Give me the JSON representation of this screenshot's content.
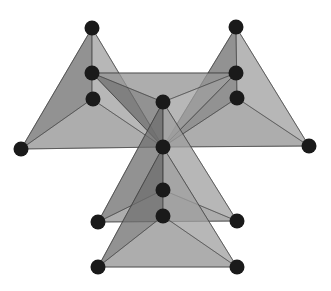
{
  "diagram": {
    "background": "#ffffff",
    "colors": {
      "face_light": "#a9a9a9",
      "face_mid": "#8a8a8a",
      "face_dark": "#5f5f5f",
      "edge": "#3a3a3a",
      "atom": "#1a1a1a"
    },
    "atoms": [
      {
        "id": "a1",
        "x": 92,
        "y": 28
      },
      {
        "id": "a2",
        "x": 236,
        "y": 27
      },
      {
        "id": "a3",
        "x": 92,
        "y": 73
      },
      {
        "id": "a4",
        "x": 93,
        "y": 99
      },
      {
        "id": "a5",
        "x": 236,
        "y": 73
      },
      {
        "id": "a6",
        "x": 237,
        "y": 98
      },
      {
        "id": "a7",
        "x": 163,
        "y": 102
      },
      {
        "id": "a8",
        "x": 163,
        "y": 147
      },
      {
        "id": "a9",
        "x": 21,
        "y": 149
      },
      {
        "id": "a10",
        "x": 309,
        "y": 146
      },
      {
        "id": "a11",
        "x": 163,
        "y": 190
      },
      {
        "id": "a12",
        "x": 163,
        "y": 216
      },
      {
        "id": "a13",
        "x": 98,
        "y": 222
      },
      {
        "id": "a14",
        "x": 98,
        "y": 267
      },
      {
        "id": "a15",
        "x": 237,
        "y": 221
      },
      {
        "id": "a16",
        "x": 237,
        "y": 267
      }
    ],
    "tetrahedra": [
      {
        "id": "t-left",
        "apex": [
          92,
          28
        ],
        "base": [
          [
            21,
            149
          ],
          [
            163,
            147
          ],
          [
            92,
            99
          ]
        ]
      },
      {
        "id": "t-right",
        "apex": [
          236,
          27
        ],
        "base": [
          [
            163,
            147
          ],
          [
            309,
            146
          ],
          [
            237,
            98
          ]
        ]
      },
      {
        "id": "t-center-up",
        "apex": [
          163,
          147
        ],
        "base": [
          [
            92,
            73
          ],
          [
            236,
            73
          ],
          [
            163,
            102
          ]
        ]
      },
      {
        "id": "t-center-down",
        "apex": [
          163,
          102
        ],
        "base": [
          [
            98,
            222
          ],
          [
            237,
            221
          ],
          [
            163,
            190
          ]
        ]
      },
      {
        "id": "t-bottom",
        "apex": [
          163,
          147
        ],
        "base": [
          [
            98,
            267
          ],
          [
            237,
            267
          ],
          [
            163,
            216
          ]
        ]
      }
    ]
  }
}
